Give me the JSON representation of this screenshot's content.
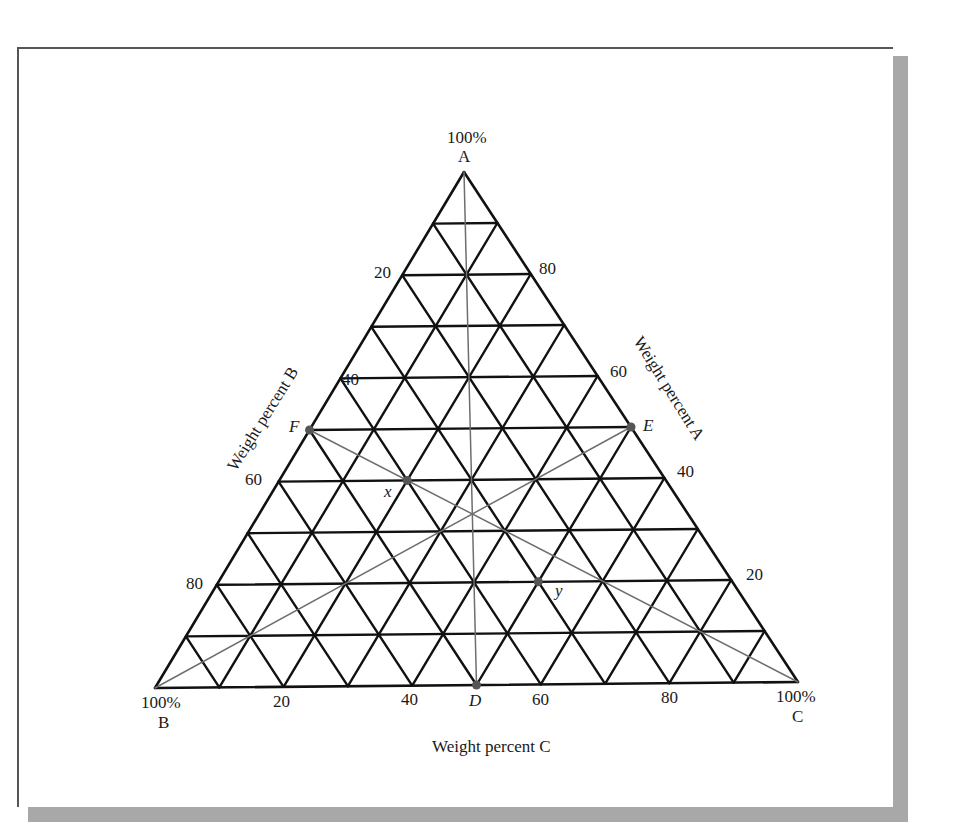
{
  "figure": {
    "vertex_a": {
      "pct": "100%",
      "name": "A"
    },
    "vertex_b": {
      "pct": "100%",
      "name": "B"
    },
    "vertex_c": {
      "pct": "100%",
      "name": "C"
    },
    "axis_a_label": "Weight percent A",
    "axis_b_label": "Weight percent B",
    "axis_c_label": "Weight percent C",
    "axis_b_ticks": [
      "20",
      "40",
      "60",
      "80"
    ],
    "axis_a_ticks": [
      "80",
      "60",
      "40",
      "20"
    ],
    "axis_c_ticks": [
      "20",
      "40",
      "60",
      "80"
    ],
    "points": [
      {
        "label": "F",
        "a": 50,
        "b": 50,
        "c": 0
      },
      {
        "label": "E",
        "a": 50,
        "b": 0,
        "c": 50
      },
      {
        "label": "D",
        "a": 0,
        "b": 50,
        "c": 50
      },
      {
        "label": "x",
        "a": 40,
        "b": 40,
        "c": 20
      },
      {
        "label": "y",
        "a": 20,
        "b": 30,
        "c": 50
      }
    ],
    "lines": [
      {
        "from": "A",
        "to": "D"
      },
      {
        "from": "F",
        "to": "C"
      },
      {
        "from": "E",
        "to": "B"
      }
    ],
    "colors": {
      "grid": "#111111",
      "construction": "#6e6e6e",
      "point": "#555555",
      "shadow": "#a8a8a8"
    }
  },
  "chart_data": {
    "type": "ternary",
    "title": "",
    "axes": {
      "top": "A",
      "bottom_left": "B",
      "bottom_right": "C"
    },
    "axis_labels": [
      "Weight percent A",
      "Weight percent B",
      "Weight percent C"
    ],
    "grid_divisions": 10,
    "ticks": [
      20,
      40,
      60,
      80
    ],
    "points": [
      {
        "label": "F",
        "A": 50,
        "B": 50,
        "C": 0
      },
      {
        "label": "E",
        "A": 50,
        "B": 0,
        "C": 50
      },
      {
        "label": "D",
        "A": 0,
        "B": 50,
        "C": 50
      },
      {
        "label": "x",
        "A": 40,
        "B": 40,
        "C": 20
      },
      {
        "label": "y",
        "A": 20,
        "B": 30,
        "C": 50
      }
    ],
    "lines": [
      [
        "A",
        "D"
      ],
      [
        "F",
        "C"
      ],
      [
        "E",
        "B"
      ]
    ]
  }
}
